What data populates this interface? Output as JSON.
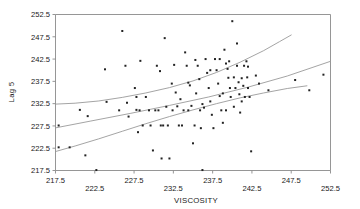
{
  "chart_data": {
    "type": "scatter",
    "title": "",
    "xlabel": "VISCOSITY",
    "ylabel": "Lag 5",
    "xlim": [
      217.5,
      252.5
    ],
    "ylim": [
      217.5,
      252.5
    ],
    "xticks": [
      217.5,
      222.5,
      227.5,
      232.5,
      237.5,
      242.5,
      247.5,
      252.5
    ],
    "yticks": [
      217.5,
      222.5,
      227.5,
      232.5,
      237.5,
      242.5,
      247.5,
      252.5
    ],
    "xtick_labels": [
      "217.5",
      "222.5",
      "227.5",
      "232.5",
      "237.5",
      "242.5",
      "247.5",
      "252.5"
    ],
    "ytick_labels": [
      "217.5",
      "222.5",
      "227.5",
      "232.5",
      "237.5",
      "242.5",
      "247.5",
      "252.5"
    ],
    "grid": false,
    "legend": "none",
    "marker_color": "#222222",
    "curve_color": "#9a9a9a",
    "frame_color": "#8a8a8a",
    "points": [
      [
        217.9,
        227.6
      ],
      [
        217.9,
        222.7
      ],
      [
        219.3,
        222.7
      ],
      [
        220.6,
        231.1
      ],
      [
        221.3,
        220.9
      ],
      [
        221.6,
        229.7
      ],
      [
        222.7,
        217.6
      ],
      [
        223.8,
        240.2
      ],
      [
        224.0,
        232.9
      ],
      [
        226.0,
        248.8
      ],
      [
        226.4,
        241.0
      ],
      [
        226.6,
        232.7
      ],
      [
        227.6,
        236.0
      ],
      [
        227.8,
        234.0
      ],
      [
        227.8,
        231.1
      ],
      [
        228.0,
        226.1
      ],
      [
        228.3,
        242.1
      ],
      [
        228.6,
        227.6
      ],
      [
        229.4,
        231.0
      ],
      [
        229.6,
        227.6
      ],
      [
        229.9,
        222.0
      ],
      [
        230.4,
        241.0
      ],
      [
        230.6,
        231.0
      ],
      [
        230.8,
        239.8
      ],
      [
        230.9,
        227.6
      ],
      [
        231.0,
        220.2
      ],
      [
        231.4,
        247.2
      ],
      [
        231.6,
        231.8
      ],
      [
        231.8,
        227.6
      ],
      [
        232.0,
        220.2
      ],
      [
        232.3,
        237.0
      ],
      [
        232.6,
        241.2
      ],
      [
        232.8,
        235.0
      ],
      [
        233.0,
        231.9
      ],
      [
        233.2,
        227.6
      ],
      [
        233.4,
        233.5
      ],
      [
        234.0,
        244.0
      ],
      [
        234.2,
        241.0
      ],
      [
        234.4,
        237.2
      ],
      [
        234.6,
        236.6
      ],
      [
        234.8,
        232.0
      ],
      [
        235.0,
        223.6
      ],
      [
        235.3,
        242.3
      ],
      [
        235.6,
        241.0
      ],
      [
        235.8,
        238.0
      ],
      [
        235.9,
        231.0
      ],
      [
        236.0,
        227.0
      ],
      [
        236.2,
        217.6
      ],
      [
        236.6,
        242.5
      ],
      [
        236.8,
        239.4
      ],
      [
        237.0,
        236.0
      ],
      [
        237.2,
        233.0
      ],
      [
        237.4,
        230.0
      ],
      [
        237.8,
        242.5
      ],
      [
        238.0,
        240.0
      ],
      [
        238.2,
        237.0
      ],
      [
        238.4,
        234.2
      ],
      [
        238.6,
        231.0
      ],
      [
        238.8,
        228.2
      ],
      [
        239.0,
        244.6
      ],
      [
        239.2,
        241.5
      ],
      [
        239.4,
        240.3
      ],
      [
        239.5,
        238.3
      ],
      [
        239.7,
        236.0
      ],
      [
        239.8,
        234.0
      ],
      [
        240.0,
        251.0
      ],
      [
        240.2,
        238.4
      ],
      [
        240.4,
        236.0
      ],
      [
        240.6,
        246.0
      ],
      [
        240.8,
        237.3
      ],
      [
        240.9,
        234.6
      ],
      [
        241.0,
        230.5
      ],
      [
        241.2,
        238.2
      ],
      [
        241.4,
        236.5
      ],
      [
        241.5,
        241.0
      ],
      [
        241.6,
        234.0
      ],
      [
        241.8,
        242.0
      ],
      [
        241.9,
        238.4
      ],
      [
        242.0,
        236.0
      ],
      [
        242.2,
        234.0
      ],
      [
        242.4,
        221.8
      ],
      [
        243.0,
        238.8
      ],
      [
        243.4,
        237.0
      ],
      [
        244.6,
        235.5
      ],
      [
        248.0,
        237.8
      ],
      [
        249.8,
        235.5
      ],
      [
        251.6,
        239.0
      ],
      [
        228.2,
        231.0
      ],
      [
        229.0,
        234.0
      ],
      [
        230.2,
        231.0
      ],
      [
        231.2,
        227.6
      ],
      [
        233.6,
        227.6
      ],
      [
        234.4,
        231.0
      ],
      [
        235.2,
        227.6
      ],
      [
        236.4,
        231.6
      ],
      [
        237.6,
        227.0
      ],
      [
        238.8,
        234.8
      ],
      [
        239.2,
        231.0
      ],
      [
        240.2,
        231.8
      ],
      [
        225.6,
        231.0
      ],
      [
        226.8,
        229.6
      ],
      [
        232.4,
        231.0
      ],
      [
        233.8,
        231.0
      ],
      [
        235.4,
        234.8
      ],
      [
        236.2,
        232.4
      ],
      [
        237.2,
        240.0
      ],
      [
        238.4,
        242.5
      ],
      [
        239.6,
        242.0
      ],
      [
        240.6,
        241.0
      ],
      [
        241.2,
        233.0
      ],
      [
        242.0,
        240.8
      ]
    ],
    "curves": [
      {
        "name": "upper-confidence-band",
        "points": [
          [
            217.6,
            232.4
          ],
          [
            220.0,
            232.6
          ],
          [
            223.0,
            233.1
          ],
          [
            226.0,
            233.9
          ],
          [
            229.0,
            234.9
          ],
          [
            232.0,
            236.1
          ],
          [
            235.0,
            237.6
          ],
          [
            238.0,
            239.5
          ],
          [
            241.0,
            241.8
          ],
          [
            244.0,
            244.4
          ],
          [
            246.0,
            246.4
          ],
          [
            247.5,
            247.9
          ]
        ]
      },
      {
        "name": "regression-line",
        "points": [
          [
            217.6,
            227.1
          ],
          [
            222.0,
            228.6
          ],
          [
            227.0,
            230.3
          ],
          [
            232.0,
            232.1
          ],
          [
            237.0,
            234.0
          ],
          [
            242.0,
            236.2
          ],
          [
            247.0,
            238.7
          ],
          [
            252.5,
            242.0
          ]
        ]
      },
      {
        "name": "lower-confidence-band",
        "points": [
          [
            217.6,
            221.8
          ],
          [
            220.0,
            223.0
          ],
          [
            223.0,
            224.6
          ],
          [
            226.0,
            226.3
          ],
          [
            229.0,
            228.0
          ],
          [
            232.0,
            229.6
          ],
          [
            235.0,
            231.1
          ],
          [
            238.0,
            232.5
          ],
          [
            241.0,
            233.8
          ],
          [
            244.0,
            234.9
          ],
          [
            247.0,
            235.9
          ],
          [
            249.5,
            236.5
          ]
        ]
      }
    ]
  }
}
